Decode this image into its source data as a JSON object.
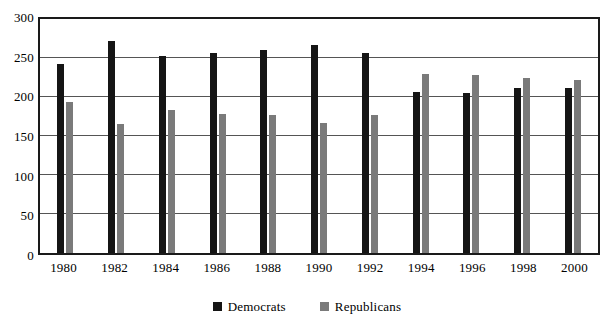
{
  "chart_data": {
    "type": "bar",
    "title": "",
    "subtitle": "",
    "xlabel": "",
    "ylabel": "",
    "categories": [
      "1980",
      "1982",
      "1984",
      "1986",
      "1988",
      "1990",
      "1992",
      "1994",
      "1996",
      "1998",
      "2000"
    ],
    "series": [
      {
        "name": "Democrats",
        "color": "#151515",
        "values": [
          242,
          272,
          253,
          257,
          260,
          267,
          256,
          206,
          205,
          211,
          211
        ]
      },
      {
        "name": "Republicans",
        "color": "#7a7a7a",
        "values": [
          193,
          166,
          183,
          178,
          177,
          167,
          177,
          230,
          228,
          225,
          222
        ]
      }
    ],
    "ylim": [
      0,
      300
    ],
    "ytick_labels": [
      "0",
      "50",
      "100",
      "150",
      "200",
      "250",
      "300"
    ],
    "ytick_values": [
      0,
      50,
      100,
      150,
      200,
      250,
      300
    ],
    "grid": true,
    "grid_axis": "y",
    "legend_position": "bottom",
    "legend": [
      {
        "label": "Democrats",
        "swatch": "legend-swatch-democrats"
      },
      {
        "label": "Republicans",
        "swatch": "legend-swatch-republicans"
      }
    ]
  }
}
